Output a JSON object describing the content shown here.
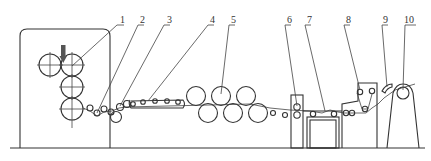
{
  "diagram": {
    "type": "production-line schematic",
    "labels": [
      {
        "id": 1,
        "text": "1"
      },
      {
        "id": 2,
        "text": "2"
      },
      {
        "id": 3,
        "text": "3"
      },
      {
        "id": 4,
        "text": "4"
      },
      {
        "id": 5,
        "text": "5"
      },
      {
        "id": 6,
        "text": "6"
      },
      {
        "id": 7,
        "text": "7"
      },
      {
        "id": 8,
        "text": "8"
      },
      {
        "id": 9,
        "text": "9"
      },
      {
        "id": 10,
        "text": "10"
      }
    ],
    "colors": {
      "line": "#333333",
      "background": "#ffffff",
      "press_arrow": "#555555"
    }
  }
}
